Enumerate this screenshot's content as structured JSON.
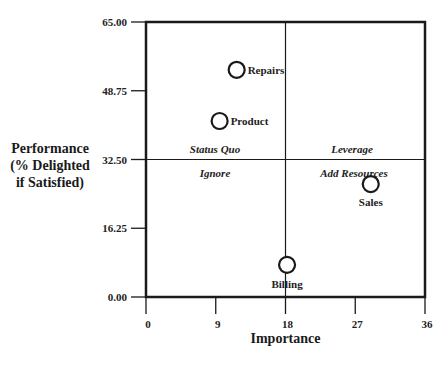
{
  "chart_data": {
    "type": "scatter",
    "title": "",
    "xlabel": "Importance",
    "ylabel_lines": [
      "Performance",
      "(% Delighted",
      "if Satisfied)"
    ],
    "xlim": [
      0,
      36
    ],
    "ylim": [
      0,
      65
    ],
    "x_ticks": [
      "0",
      "9",
      "18",
      "27",
      "36"
    ],
    "y_ticks": [
      "0.00",
      "16.25",
      "32.50",
      "48.75",
      "65.00"
    ],
    "grid": false,
    "quadrant_divider": {
      "x": 18,
      "y": 32.5
    },
    "quadrant_labels": [
      {
        "text": "Status Quo",
        "position": "upper-left"
      },
      {
        "text": "Leverage",
        "position": "upper-right"
      },
      {
        "text": "Ignore",
        "position": "lower-left"
      },
      {
        "text": "Add Resources",
        "position": "lower-right"
      }
    ],
    "points": [
      {
        "label": "Repairs",
        "x": 11.7,
        "y": 53.7
      },
      {
        "label": "Product",
        "x": 9.5,
        "y": 41.6
      },
      {
        "label": "Sales",
        "x": 29.0,
        "y": 26.7
      },
      {
        "label": "Billing",
        "x": 18.2,
        "y": 7.6
      }
    ]
  }
}
